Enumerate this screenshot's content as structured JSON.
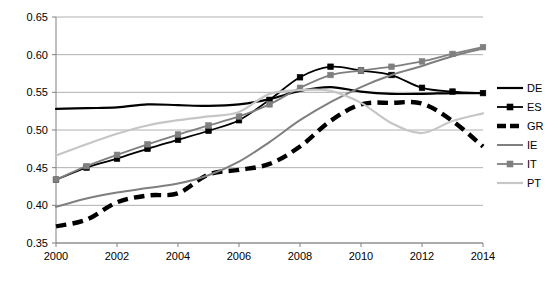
{
  "chart_data": {
    "type": "line",
    "title": "",
    "xlabel": "",
    "ylabel": "",
    "x": [
      2000,
      2001,
      2002,
      2003,
      2004,
      2005,
      2006,
      2007,
      2008,
      2009,
      2010,
      2011,
      2012,
      2013,
      2014
    ],
    "xlim": [
      2000,
      2014
    ],
    "ylim": [
      0.35,
      0.65
    ],
    "yticks": [
      0.35,
      0.4,
      0.45,
      0.5,
      0.55,
      0.6,
      0.65
    ],
    "ytick_labels": [
      "0.35",
      "0.40",
      "0.45",
      "0.50",
      "0.55",
      "0.60",
      "0.65"
    ],
    "xticks": [
      2000,
      2002,
      2004,
      2006,
      2008,
      2010,
      2012,
      2014
    ],
    "xtick_labels": [
      "2000",
      "2002",
      "2004",
      "2006",
      "2008",
      "2010",
      "2012",
      "2014"
    ],
    "grid": true,
    "grid_axis": "y",
    "legend_position": "right",
    "series": [
      {
        "name": "DE",
        "color": "#000000",
        "width": 2.2,
        "dash": "none",
        "marker": "none",
        "values": [
          0.528,
          0.529,
          0.53,
          0.534,
          0.533,
          0.532,
          0.534,
          0.541,
          0.552,
          0.557,
          0.551,
          0.548,
          0.548,
          0.549,
          0.549
        ]
      },
      {
        "name": "ES",
        "color": "#000000",
        "width": 1.8,
        "dash": "none",
        "marker": "square",
        "values": [
          0.434,
          0.45,
          0.462,
          0.475,
          0.487,
          0.499,
          0.513,
          0.54,
          0.57,
          0.584,
          0.579,
          0.573,
          0.556,
          0.551,
          0.549
        ]
      },
      {
        "name": "GR",
        "color": "#000000",
        "width": 4.4,
        "dash": "dashed",
        "marker": "none",
        "values": [
          0.372,
          0.381,
          0.404,
          0.413,
          0.416,
          0.441,
          0.447,
          0.455,
          0.478,
          0.512,
          0.534,
          0.536,
          0.535,
          0.512,
          0.478
        ]
      },
      {
        "name": "IE",
        "color": "#7f7f7f",
        "width": 2.0,
        "dash": "none",
        "marker": "none",
        "values": [
          0.398,
          0.409,
          0.417,
          0.423,
          0.429,
          0.44,
          0.458,
          0.484,
          0.513,
          0.537,
          0.557,
          0.573,
          0.585,
          0.598,
          0.608
        ]
      },
      {
        "name": "IT",
        "color": "#7f7f7f",
        "width": 1.8,
        "dash": "none",
        "marker": "square",
        "values": [
          0.434,
          0.452,
          0.467,
          0.481,
          0.494,
          0.506,
          0.518,
          0.534,
          0.556,
          0.573,
          0.579,
          0.584,
          0.591,
          0.601,
          0.61
        ]
      },
      {
        "name": "PT",
        "color": "#c6c6c6",
        "width": 2.2,
        "dash": "none",
        "marker": "none",
        "values": [
          0.466,
          0.481,
          0.495,
          0.506,
          0.513,
          0.518,
          0.524,
          0.548,
          0.553,
          0.552,
          0.536,
          0.509,
          0.496,
          0.512,
          0.522
        ]
      }
    ]
  },
  "legend": {
    "entries": [
      {
        "label": "DE"
      },
      {
        "label": "ES"
      },
      {
        "label": "GR"
      },
      {
        "label": "IE"
      },
      {
        "label": "IT"
      },
      {
        "label": "PT"
      }
    ]
  }
}
